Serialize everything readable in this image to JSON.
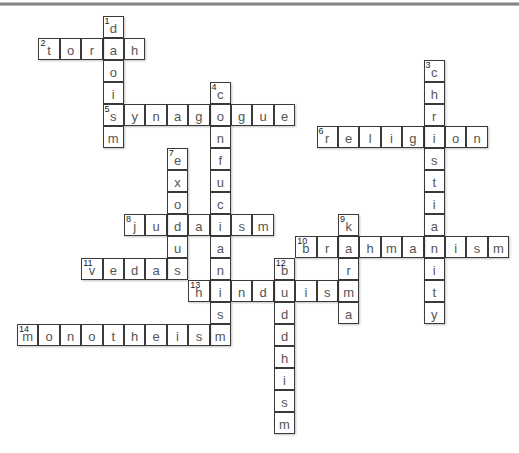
{
  "puzzle": {
    "type": "crossword",
    "grid": {
      "origin_x": 17,
      "origin_y": 16,
      "cell_w": 21.4,
      "cell_h": 22
    },
    "words": [
      {
        "number": 1,
        "direction": "down",
        "answer": "daoism",
        "row": 0,
        "col": 4
      },
      {
        "number": 2,
        "direction": "across",
        "answer": "torah",
        "row": 1,
        "col": 1
      },
      {
        "number": 3,
        "direction": "down",
        "answer": "christianity",
        "row": 2,
        "col": 19
      },
      {
        "number": 4,
        "direction": "down",
        "answer": "confucianism",
        "row": 3,
        "col": 9
      },
      {
        "number": 5,
        "direction": "across",
        "answer": "synagogue",
        "row": 4,
        "col": 4
      },
      {
        "number": 6,
        "direction": "across",
        "answer": "religion",
        "row": 5,
        "col": 14
      },
      {
        "number": 7,
        "direction": "down",
        "answer": "exodus",
        "row": 6,
        "col": 7
      },
      {
        "number": 8,
        "direction": "across",
        "answer": "judaism",
        "row": 9,
        "col": 5
      },
      {
        "number": 9,
        "direction": "down",
        "answer": "karma",
        "row": 9,
        "col": 15
      },
      {
        "number": 10,
        "direction": "across",
        "answer": "brahmanism",
        "row": 10,
        "col": 13
      },
      {
        "number": 11,
        "direction": "across",
        "answer": "vedas",
        "row": 11,
        "col": 3
      },
      {
        "number": 12,
        "direction": "down",
        "answer": "buddhism",
        "row": 11,
        "col": 12
      },
      {
        "number": 13,
        "direction": "across",
        "answer": "hinduism",
        "row": 12,
        "col": 8
      },
      {
        "number": 14,
        "direction": "across",
        "answer": "monotheism",
        "row": 14,
        "col": 0
      }
    ]
  }
}
